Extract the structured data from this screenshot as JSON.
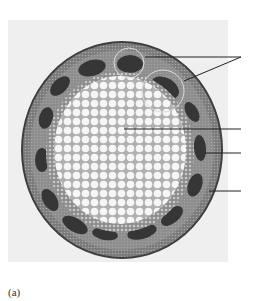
{
  "figure": {
    "caption": "(a)",
    "colors": {
      "page_bg": "#ffffff",
      "panel_bg": "#efefef",
      "epidermis": "#4a4a4a",
      "cortex": "#8a8a8a",
      "vascular_bundle": "#3b3b3b",
      "pith_cell_fill": "#f4f4f4",
      "pith_cell_wall": "#9a9a9a",
      "leader_line": "#222222"
    },
    "labels": [
      {
        "id": "vascular-bundle",
        "text": "",
        "from": [
          [
            145,
            57
          ],
          [
            185,
            80
          ]
        ],
        "to": [
          240,
          57
        ]
      },
      {
        "id": "pith",
        "text": "",
        "from": [
          [
            125,
            129
          ]
        ],
        "to": [
          240,
          129
        ]
      },
      {
        "id": "cortex",
        "text": "",
        "from": [
          [
            205,
            153
          ]
        ],
        "to": [
          240,
          153
        ]
      },
      {
        "id": "epidermis",
        "text": "",
        "from": [
          [
            210,
            190
          ]
        ],
        "to": [
          240,
          190
        ]
      }
    ]
  }
}
